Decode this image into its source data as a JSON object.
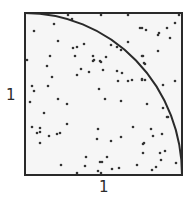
{
  "diagram": {
    "labels": {
      "y_side": "1",
      "x_side": "1"
    },
    "colors": {
      "square_fill": "#f6f6f6",
      "square_stroke": "#2a2a2a",
      "arc_stroke": "#2a2a2a",
      "point": "#333333"
    },
    "square": {
      "x0": 25,
      "y0": 13,
      "x1": 182,
      "y1": 175
    },
    "quarter_circle": {
      "center": [
        25,
        175
      ],
      "radius": 157
    },
    "points": [
      [
        68,
        15
      ],
      [
        72,
        19
      ],
      [
        101,
        15
      ],
      [
        128,
        15
      ],
      [
        179,
        15
      ],
      [
        175,
        23
      ],
      [
        54,
        24
      ],
      [
        140,
        28
      ],
      [
        142,
        28
      ],
      [
        146,
        30
      ],
      [
        167,
        28
      ],
      [
        34,
        31
      ],
      [
        159,
        33
      ],
      [
        158,
        35
      ],
      [
        170,
        38
      ],
      [
        58,
        41
      ],
      [
        128,
        42
      ],
      [
        84,
        44
      ],
      [
        111,
        45
      ],
      [
        77,
        47
      ],
      [
        73,
        48
      ],
      [
        117,
        47
      ],
      [
        121,
        50
      ],
      [
        158,
        51
      ],
      [
        50,
        56
      ],
      [
        75,
        56
      ],
      [
        93,
        56
      ],
      [
        106,
        57
      ],
      [
        142,
        56
      ],
      [
        143,
        56
      ],
      [
        27,
        60
      ],
      [
        94,
        60
      ],
      [
        100,
        61
      ],
      [
        93,
        61
      ],
      [
        101,
        62
      ],
      [
        144,
        63
      ],
      [
        145,
        64
      ],
      [
        47,
        66
      ],
      [
        81,
        69
      ],
      [
        103,
        70
      ],
      [
        117,
        71
      ],
      [
        89,
        72
      ],
      [
        122,
        73
      ],
      [
        77,
        75
      ],
      [
        52,
        77
      ],
      [
        142,
        79
      ],
      [
        132,
        80
      ],
      [
        142,
        80
      ],
      [
        145,
        80
      ],
      [
        118,
        81
      ],
      [
        128,
        81
      ],
      [
        175,
        81
      ],
      [
        163,
        85
      ],
      [
        32,
        86
      ],
      [
        48,
        86
      ],
      [
        99,
        89
      ],
      [
        34,
        91
      ],
      [
        58,
        99
      ],
      [
        105,
        99
      ],
      [
        121,
        101
      ],
      [
        30,
        102
      ],
      [
        67,
        104
      ],
      [
        147,
        104
      ],
      [
        163,
        108
      ],
      [
        44,
        113
      ],
      [
        167,
        117
      ],
      [
        168,
        117
      ],
      [
        67,
        124
      ],
      [
        32,
        127
      ],
      [
        133,
        127
      ],
      [
        40,
        128
      ],
      [
        98,
        129
      ],
      [
        151,
        129
      ],
      [
        40,
        132
      ],
      [
        37,
        133
      ],
      [
        60,
        133
      ],
      [
        57,
        134
      ],
      [
        162,
        134
      ],
      [
        49,
        136
      ],
      [
        153,
        136
      ],
      [
        121,
        137
      ],
      [
        97,
        139
      ],
      [
        111,
        141
      ],
      [
        40,
        143
      ],
      [
        144,
        143
      ],
      [
        143,
        144
      ],
      [
        165,
        151
      ],
      [
        143,
        153
      ],
      [
        160,
        153
      ],
      [
        86,
        157
      ],
      [
        107,
        157
      ],
      [
        161,
        160
      ],
      [
        100,
        162
      ],
      [
        102,
        162
      ],
      [
        176,
        163
      ],
      [
        61,
        165
      ],
      [
        137,
        165
      ],
      [
        85,
        166
      ],
      [
        156,
        167
      ],
      [
        119,
        168
      ],
      [
        112,
        169
      ],
      [
        152,
        170
      ],
      [
        98,
        171
      ],
      [
        101,
        173
      ],
      [
        77,
        173
      ]
    ]
  }
}
